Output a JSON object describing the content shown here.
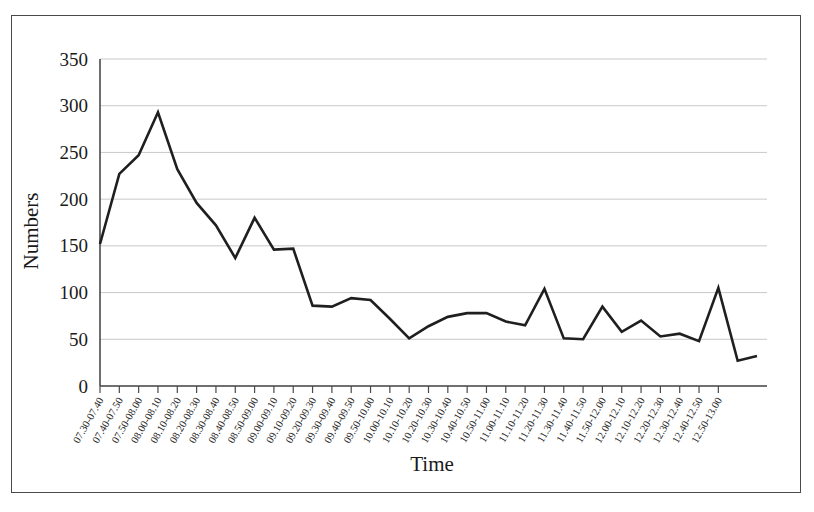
{
  "chart_data": {
    "type": "line",
    "title": "",
    "xlabel": "Time",
    "ylabel": "Numbers",
    "ylim": [
      0,
      350
    ],
    "ytick_step": 50,
    "yticks": [
      0,
      50,
      100,
      150,
      200,
      250,
      300,
      350
    ],
    "grid": true,
    "legend": false,
    "legend_position": "none",
    "line_color": "#1f1f1f",
    "gridline_color": "#c9c9c9",
    "axis_color": "#4a4a4a",
    "categories": [
      "07.30-07.40",
      "07.40-07.50",
      "07.50-08.00",
      "08.00-08.10",
      "08.10-08.20",
      "08.20-08.30",
      "08.30-08.40",
      "08.40-08.50",
      "08.50-09.00",
      "09.00-09.10",
      "09.10-09.20",
      "09.20-09.30",
      "09.30-09.40",
      "09.40-09.50",
      "09.50-10.00",
      "10.00-10.10",
      "10.10-10.20",
      "10.20-10.30",
      "10.30-10.40",
      "10.40-10.50",
      "10.50-11.00",
      "11.00-11.10",
      "11.10-11.20",
      "11.20-11.30",
      "11.30-11.40",
      "11.40-11.50",
      "11.50-12.00",
      "12.00-12.10",
      "12.10-12.20",
      "12.20-12.30",
      "12.30-12.40",
      "12.40-12.50",
      "12.50-13.00"
    ],
    "values": [
      152,
      227,
      247,
      293,
      232,
      196,
      172,
      137,
      180,
      146,
      147,
      86,
      85,
      94,
      92,
      72,
      51,
      64,
      74,
      78,
      78,
      69,
      65,
      104,
      51,
      50,
      85,
      58,
      70,
      53,
      56,
      48,
      105
    ],
    "tail_values": [
      27,
      32
    ],
    "note": "Line series of counts per 10-minute interval from 07.30 to 13.00"
  }
}
